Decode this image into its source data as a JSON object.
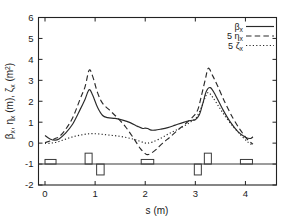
{
  "chart_data": {
    "type": "line",
    "title": "",
    "xlabel": "s (m)",
    "ylabel": "βx, ηx (m), ζx (m2)",
    "xlim": [
      -0.13,
      4.62
    ],
    "ylim": [
      -2,
      6
    ],
    "xticks": [
      0,
      1,
      2,
      3,
      4
    ],
    "xtick_labels": [
      "0",
      "1",
      "2",
      "3",
      "4"
    ],
    "yticks": [
      -2,
      -1,
      0,
      1,
      2,
      3,
      4,
      5,
      6
    ],
    "ytick_labels": [
      "-2",
      "-1",
      "0",
      "1",
      "2",
      "3",
      "4",
      "5",
      "6"
    ],
    "grid": false,
    "legend_position": "top-right",
    "series": [
      {
        "name": "βx",
        "style": "solid",
        "x": [
          0.0,
          0.1,
          0.2,
          0.28,
          0.4,
          0.55,
          0.7,
          0.8,
          0.88,
          0.95,
          1.05,
          1.15,
          1.25,
          1.4,
          1.55,
          1.7,
          1.85,
          1.95,
          2.0,
          2.05,
          2.12,
          2.2,
          2.3,
          2.45,
          2.6,
          2.75,
          2.9,
          3.0,
          3.08,
          3.15,
          3.22,
          3.3,
          3.4,
          3.55,
          3.7,
          3.85,
          4.0,
          4.1,
          4.15
        ],
        "y": [
          0.36,
          0.2,
          0.14,
          0.2,
          0.45,
          0.9,
          1.6,
          2.1,
          2.55,
          2.3,
          1.7,
          1.32,
          1.22,
          1.18,
          1.1,
          0.98,
          0.8,
          0.7,
          0.72,
          0.7,
          0.62,
          0.62,
          0.66,
          0.74,
          0.86,
          0.98,
          1.08,
          1.12,
          1.35,
          1.9,
          2.48,
          2.65,
          2.3,
          1.6,
          1.0,
          0.55,
          0.28,
          0.22,
          0.3
        ]
      },
      {
        "name": "5 ηx",
        "style": "dashed",
        "x": [
          0.0,
          0.1,
          0.2,
          0.28,
          0.4,
          0.55,
          0.7,
          0.8,
          0.88,
          0.95,
          1.05,
          1.15,
          1.3,
          1.45,
          1.6,
          1.75,
          1.9,
          2.0,
          2.05,
          2.12,
          2.22,
          2.35,
          2.5,
          2.65,
          2.8,
          2.95,
          3.05,
          3.12,
          3.2,
          3.26,
          3.35,
          3.45,
          3.6,
          3.75,
          3.9,
          4.05,
          4.15
        ],
        "y": [
          0.02,
          0.1,
          0.22,
          0.3,
          0.62,
          1.2,
          2.1,
          2.7,
          3.48,
          3.2,
          2.4,
          1.9,
          1.55,
          1.2,
          0.8,
          0.3,
          -0.25,
          -0.5,
          -0.55,
          -0.48,
          -0.3,
          0.0,
          0.3,
          0.62,
          0.92,
          1.25,
          1.6,
          2.25,
          3.05,
          3.58,
          3.2,
          2.7,
          1.9,
          1.2,
          0.62,
          0.15,
          -0.05
        ]
      },
      {
        "name": "5 ζx",
        "style": "dotted",
        "x": [
          0.0,
          0.12,
          0.25,
          0.4,
          0.55,
          0.7,
          0.85,
          1.0,
          1.15,
          1.3,
          1.45,
          1.6,
          1.75,
          1.88,
          1.98,
          2.05,
          2.15,
          2.3,
          2.45,
          2.6,
          2.75,
          2.9,
          3.02,
          3.12,
          3.2,
          3.26,
          3.35,
          3.48,
          3.62,
          3.78,
          3.92,
          4.05,
          4.15
        ],
        "y": [
          -0.02,
          0.0,
          0.06,
          0.18,
          0.3,
          0.38,
          0.44,
          0.45,
          0.42,
          0.38,
          0.34,
          0.28,
          0.2,
          0.1,
          0.02,
          0.0,
          0.06,
          0.22,
          0.42,
          0.6,
          0.78,
          1.0,
          1.22,
          1.7,
          2.2,
          2.42,
          2.18,
          1.7,
          1.2,
          0.72,
          0.35,
          0.05,
          -0.12
        ]
      }
    ],
    "lattice_elements": [
      {
        "name": "element-1",
        "x0": 0.0,
        "x1": 0.22,
        "height": 0.22,
        "direction": "up"
      },
      {
        "name": "element-2",
        "x0": 0.8,
        "x1": 0.94,
        "height": 0.52,
        "direction": "up"
      },
      {
        "name": "element-3",
        "x0": 1.03,
        "x1": 1.18,
        "height": 0.52,
        "direction": "down"
      },
      {
        "name": "element-4",
        "x0": 1.92,
        "x1": 2.17,
        "height": 0.22,
        "direction": "up"
      },
      {
        "name": "element-5",
        "x0": 2.98,
        "x1": 3.12,
        "height": 0.52,
        "direction": "down"
      },
      {
        "name": "element-6",
        "x0": 3.18,
        "x1": 3.32,
        "height": 0.52,
        "direction": "up"
      },
      {
        "name": "element-7",
        "x0": 3.9,
        "x1": 4.14,
        "height": 0.22,
        "direction": "up"
      }
    ],
    "lattice_baseline": -1
  },
  "legend": {
    "entries": [
      {
        "label": "β",
        "sub": "x",
        "prefix": "",
        "style": "solid"
      },
      {
        "label": "η",
        "sub": "x",
        "prefix": "5",
        "style": "dashed"
      },
      {
        "label": "ζ",
        "sub": "x",
        "prefix": "5",
        "style": "dotted"
      }
    ]
  },
  "axes": {
    "x_title": "s (m)",
    "y_title_parts": {
      "beta": "β",
      "beta_sub": "x",
      "comma1": ", ",
      "eta": "η",
      "eta_sub": "x",
      "unit_m": " (m), ",
      "zeta": "ζ",
      "zeta_sub": "x",
      "unit_m2": " (m",
      "unit_m2_sup": "2",
      "unit_close": ")"
    }
  }
}
